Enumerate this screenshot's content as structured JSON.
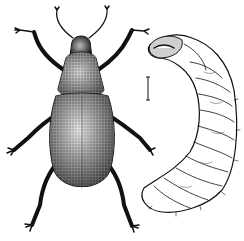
{
  "figure": {
    "description": "Black-and-white engraving of a weevil beetle (dorsal view) beside its curved larva (grub) with a scale bar",
    "subjects": [
      {
        "name": "adult-weevil",
        "view": "dorsal"
      },
      {
        "name": "larva-grub",
        "view": "lateral, curved"
      }
    ],
    "scale_bar": {
      "present": true
    },
    "colors": {
      "ink": "#111111",
      "paper": "#ffffff"
    }
  }
}
